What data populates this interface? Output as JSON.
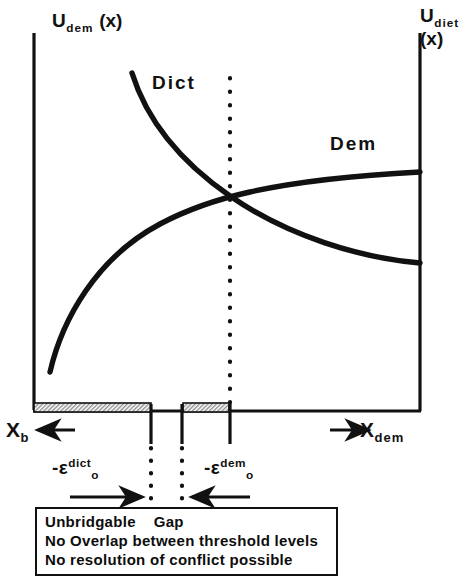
{
  "figure": {
    "axis_left": {
      "base": "U",
      "sub": "dem",
      "arg": "(x)"
    },
    "axis_right": {
      "base": "U",
      "sub": "diet",
      "arg": "(x)"
    },
    "curves": [
      {
        "name": "dict-curve",
        "label": "Dict",
        "shape": "decreasing-convex",
        "points": [
          [
            132,
            73
          ],
          [
            150,
            110
          ],
          [
            170,
            140
          ],
          [
            195,
            168
          ],
          [
            230,
            196
          ],
          [
            280,
            224
          ],
          [
            340,
            248
          ],
          [
            420,
            262
          ]
        ]
      },
      {
        "name": "dem-curve",
        "label": "Dem",
        "shape": "increasing-concave",
        "points": [
          [
            50,
            372
          ],
          [
            62,
            340
          ],
          [
            80,
            308
          ],
          [
            105,
            276
          ],
          [
            140,
            244
          ],
          [
            185,
            214
          ],
          [
            230,
            196
          ],
          [
            300,
            180
          ],
          [
            360,
            174
          ],
          [
            420,
            172
          ]
        ]
      }
    ],
    "crossing_point": {
      "x": 230,
      "y": 196
    },
    "x_axis_left_label": {
      "base": "X",
      "sub": "b",
      "arrow": "←"
    },
    "x_axis_right_label": {
      "base": "X",
      "sub": "dem",
      "arrow": "→"
    },
    "thresholds": [
      {
        "name": "epsilon-dict",
        "minus": "-",
        "eps": "ε",
        "sup": "dict",
        "sub": "o"
      },
      {
        "name": "epsilon-dem",
        "minus": "-",
        "eps": "ε",
        "sup": "dem",
        "sub": "o"
      }
    ],
    "shaded_bars": [
      {
        "name": "dict-threshold-bar",
        "x": 33,
        "width": 118,
        "y": 404,
        "height": 9
      },
      {
        "name": "dem-threshold-bar",
        "x": 183,
        "width": 46,
        "y": 404,
        "height": 9
      }
    ],
    "tick_marks": [
      151,
      182,
      230
    ],
    "dotted_lines": [
      {
        "name": "dotted-line-gap-left",
        "x": 151,
        "y_top": 78,
        "y_bottom": 502
      },
      {
        "name": "dotted-line-gap-right",
        "x": 182,
        "y_top": 440,
        "y_bottom": 502
      },
      {
        "name": "dotted-line-crossing",
        "x": 230,
        "y_top": 78,
        "y_bottom": 404
      }
    ],
    "gap_arrows": [
      {
        "name": "arrow-right",
        "direction": "right",
        "x1": 70,
        "x2": 146,
        "y": 497
      },
      {
        "name": "arrow-left",
        "direction": "left",
        "x1": 246,
        "x2": 188,
        "y": 497
      }
    ],
    "callout_box": {
      "lines": [
        "Unbridgable    Gap",
        "No Overlap between threshold levels",
        "No resolution of conflict possible"
      ]
    },
    "frame": {
      "x": 33,
      "y": 33,
      "right": 420,
      "bottom": 410
    },
    "colors": {
      "ink": "#111111",
      "paper": "#ffffff",
      "hatch": "#9a9a9a"
    }
  }
}
